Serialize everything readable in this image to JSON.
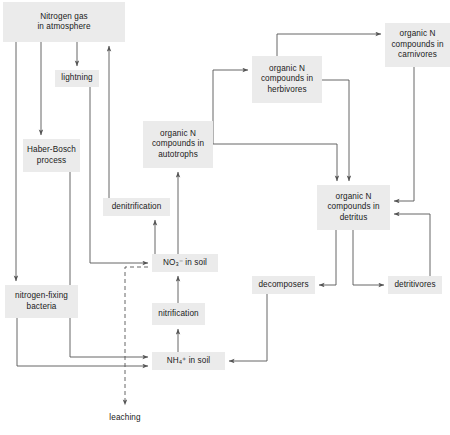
{
  "diagram": {
    "box_fill": "#ebebeb",
    "text_color": "#1a1a1a",
    "line_color": "#555555",
    "nodes": [
      {
        "id": "atmosphere",
        "label": "Nitrogen gas\nin atmosphere",
        "x": 3,
        "y": 2,
        "w": 122,
        "h": 40,
        "boxed": true
      },
      {
        "id": "lightning",
        "label": "lightning",
        "x": 55,
        "y": 70,
        "w": 44,
        "h": 17,
        "boxed": true
      },
      {
        "id": "haber",
        "label": "Haber-Bosch\nprocess",
        "x": 23,
        "y": 139,
        "w": 57,
        "h": 33,
        "boxed": true
      },
      {
        "id": "nfixing",
        "label": "nitrogen-fixing\nbacteria",
        "x": 5,
        "y": 285,
        "w": 73,
        "h": 33,
        "boxed": true
      },
      {
        "id": "denitrify",
        "label": "denitrification",
        "x": 103,
        "y": 198,
        "w": 67,
        "h": 18,
        "boxed": true
      },
      {
        "id": "autotrophs",
        "label": "organic N\ncompounds in\nautotrophs",
        "x": 143,
        "y": 121,
        "w": 70,
        "h": 47,
        "boxed": true
      },
      {
        "id": "nitrate",
        "label": "NO₃⁻ in soil",
        "x": 152,
        "y": 254,
        "w": 66,
        "h": 18,
        "boxed": true
      },
      {
        "id": "nitrification",
        "label": "nitrification",
        "x": 152,
        "y": 303,
        "w": 53,
        "h": 22,
        "boxed": true
      },
      {
        "id": "ammonium",
        "label": "NH₄⁺ in soil",
        "x": 152,
        "y": 352,
        "w": 73,
        "h": 18,
        "boxed": true
      },
      {
        "id": "leaching",
        "label": "leaching",
        "x": 104,
        "y": 411,
        "w": 42,
        "h": 14,
        "boxed": false
      },
      {
        "id": "herbivores",
        "label": "organic N\ncompounds in\nherbivores",
        "x": 252,
        "y": 56,
        "w": 70,
        "h": 47,
        "boxed": true
      },
      {
        "id": "carnivores",
        "label": "organic N\ncompounds in\ncarnivores",
        "x": 385,
        "y": 23,
        "w": 65,
        "h": 44,
        "boxed": true
      },
      {
        "id": "detritus",
        "label": "organic N\ncompounds in\ndetritus",
        "x": 317,
        "y": 185,
        "w": 73,
        "h": 45,
        "boxed": true
      },
      {
        "id": "decomposers",
        "label": "decomposers",
        "x": 252,
        "y": 276,
        "w": 63,
        "h": 18,
        "boxed": true
      },
      {
        "id": "detritivores",
        "label": "detritivores",
        "x": 388,
        "y": 276,
        "w": 54,
        "h": 18,
        "boxed": true
      }
    ],
    "edges": [
      {
        "id": "atmosphere-to-lightning",
        "from": "atmosphere",
        "to": "lightning",
        "style": "solid"
      },
      {
        "id": "atmosphere-to-haber",
        "from": "atmosphere",
        "to": "haber",
        "style": "solid"
      },
      {
        "id": "atmosphere-to-nfixing",
        "from": "atmosphere",
        "to": "nfixing",
        "style": "solid"
      },
      {
        "id": "denitrification-to-atmosphere",
        "from": "denitrify",
        "to": "atmosphere",
        "style": "solid"
      },
      {
        "id": "lightning-to-nitrate",
        "from": "lightning",
        "to": "nitrate",
        "style": "solid"
      },
      {
        "id": "haber-to-ammonium",
        "from": "haber",
        "to": "ammonium",
        "style": "solid"
      },
      {
        "id": "nfixing-to-ammonium",
        "from": "nfixing",
        "to": "ammonium",
        "style": "solid"
      },
      {
        "id": "nitrate-to-denitrification",
        "from": "nitrate",
        "to": "denitrify",
        "style": "solid"
      },
      {
        "id": "nitrate-to-autotrophs",
        "from": "nitrate",
        "to": "autotrophs",
        "style": "solid"
      },
      {
        "id": "ammonium-to-nitrification",
        "from": "ammonium",
        "to": "nitrification",
        "style": "solid"
      },
      {
        "id": "nitrification-to-nitrate",
        "from": "nitrification",
        "to": "nitrate",
        "style": "solid"
      },
      {
        "id": "nitrate-to-leaching",
        "from": "nitrate",
        "to": "leaching",
        "style": "dashed"
      },
      {
        "id": "autotrophs-to-herbivores",
        "from": "autotrophs",
        "to": "herbivores",
        "style": "solid"
      },
      {
        "id": "autotrophs-to-detritus",
        "from": "autotrophs",
        "to": "detritus",
        "style": "solid"
      },
      {
        "id": "herbivores-to-carnivores",
        "from": "herbivores",
        "to": "carnivores",
        "style": "solid"
      },
      {
        "id": "herbivores-to-detritus",
        "from": "herbivores",
        "to": "detritus",
        "style": "solid"
      },
      {
        "id": "carnivores-to-detritus",
        "from": "carnivores",
        "to": "detritus",
        "style": "solid"
      },
      {
        "id": "detritus-to-decomposers",
        "from": "detritus",
        "to": "decomposers",
        "style": "solid"
      },
      {
        "id": "detritus-to-detritivores",
        "from": "detritus",
        "to": "detritivores",
        "style": "solid"
      },
      {
        "id": "detritivores-to-detritus",
        "from": "detritivores",
        "to": "detritus",
        "style": "solid"
      },
      {
        "id": "decomposers-to-ammonium",
        "from": "decomposers",
        "to": "ammonium",
        "style": "solid"
      }
    ]
  }
}
